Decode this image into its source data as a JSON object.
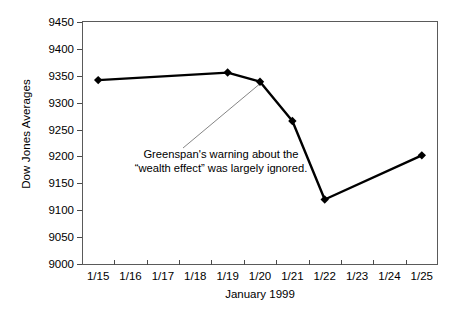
{
  "chart_data": {
    "type": "line",
    "title": "",
    "xlabel": "January 1999",
    "ylabel": "Dow Jones Averages",
    "ylim": [
      9000,
      9450
    ],
    "yticks": [
      9000,
      9050,
      9100,
      9150,
      9200,
      9250,
      9300,
      9350,
      9400,
      9450
    ],
    "categories": [
      "1/15",
      "1/16",
      "1/17",
      "1/18",
      "1/19",
      "1/20",
      "1/21",
      "1/22",
      "1/23",
      "1/24",
      "1/25"
    ],
    "grid": false,
    "legend": false,
    "series": [
      {
        "name": "Dow Jones Averages",
        "color": "#000000",
        "marker": "diamond",
        "points": [
          {
            "x": "1/15",
            "y": 9342
          },
          {
            "x": "1/19",
            "y": 9356
          },
          {
            "x": "1/20",
            "y": 9339
          },
          {
            "x": "1/21",
            "y": 9266
          },
          {
            "x": "1/22",
            "y": 9120
          },
          {
            "x": "1/25",
            "y": 9202
          }
        ]
      }
    ],
    "annotations": [
      {
        "text": "Greenspan's warning about the\n“wealth effect” was largely ignored.",
        "points_to": "1/20",
        "leader_line": true
      }
    ]
  },
  "axis": {
    "y_title": "Dow Jones Averages",
    "x_title": "January 1999",
    "y_tick_labels": [
      "9450",
      "9400",
      "9350",
      "9300",
      "9250",
      "9200",
      "9150",
      "9100",
      "9050",
      "9000"
    ],
    "x_tick_labels": [
      "1/15",
      "1/16",
      "1/17",
      "1/18",
      "1/19",
      "1/20",
      "1/21",
      "1/22",
      "1/23",
      "1/24",
      "1/25"
    ]
  },
  "annotation": {
    "line1": "Greenspan's warning about the",
    "line2": "“wealth effect” was largely ignored."
  }
}
